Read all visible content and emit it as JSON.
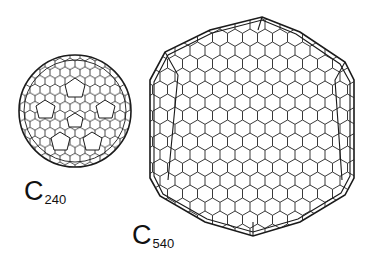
{
  "figure": {
    "molecules": [
      {
        "symbol": "C",
        "subscript": "240",
        "shape": "near-spherical fullerene cage"
      },
      {
        "symbol": "C",
        "subscript": "540",
        "shape": "faceted icosahedral fullerene cage"
      }
    ],
    "colors": {
      "line": "#1a1a1a",
      "background": "#ffffff"
    }
  }
}
